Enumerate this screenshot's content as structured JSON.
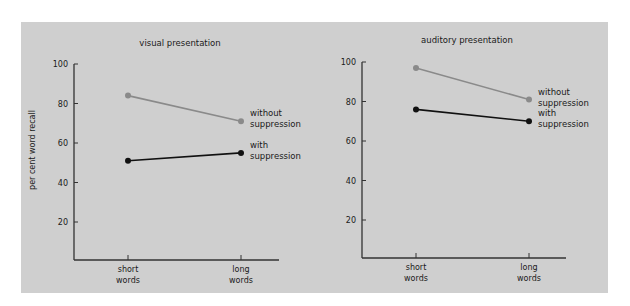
{
  "colors": {
    "background": "#ffffff",
    "panel": "#cfcfcf",
    "axis": "#333333",
    "with_suppression": "#111111",
    "without_suppression": "#8a8a8a"
  },
  "ylabel": "per cent word recall",
  "charts": [
    {
      "title": "visual presentation",
      "yticks": [
        "20",
        "40",
        "60",
        "80",
        "100"
      ],
      "categories": [
        [
          "short",
          "words"
        ],
        [
          "long",
          "words"
        ]
      ],
      "series_labels": {
        "without": [
          "without",
          "suppression"
        ],
        "with": [
          "with",
          "suppression"
        ]
      }
    },
    {
      "title": "auditory presentation",
      "yticks": [
        "20",
        "40",
        "60",
        "80",
        "100"
      ],
      "categories": [
        [
          "short",
          "words"
        ],
        [
          "long",
          "words"
        ]
      ],
      "series_labels": {
        "without": [
          "without",
          "suppression"
        ],
        "with": [
          "with",
          "suppression"
        ]
      }
    }
  ],
  "chart_data": [
    {
      "type": "line",
      "title": "visual presentation",
      "xlabel": "",
      "ylabel": "per cent word recall",
      "categories": [
        "short words",
        "long words"
      ],
      "series": [
        {
          "name": "without suppression",
          "values": [
            84,
            71
          ],
          "color": "#8a8a8a"
        },
        {
          "name": "with suppression",
          "values": [
            51,
            55
          ],
          "color": "#111111"
        }
      ],
      "ylim": [
        0,
        100
      ],
      "yticks": [
        20,
        40,
        60,
        80,
        100
      ],
      "grid": false,
      "legend_position": "inline-right"
    },
    {
      "type": "line",
      "title": "auditory presentation",
      "xlabel": "",
      "ylabel": "per cent word recall",
      "categories": [
        "short words",
        "long words"
      ],
      "series": [
        {
          "name": "without suppression",
          "values": [
            97,
            81
          ],
          "color": "#8a8a8a"
        },
        {
          "name": "with suppression",
          "values": [
            76,
            70
          ],
          "color": "#111111"
        }
      ],
      "ylim": [
        0,
        100
      ],
      "yticks": [
        20,
        40,
        60,
        80,
        100
      ],
      "grid": false,
      "legend_position": "inline-right"
    }
  ]
}
